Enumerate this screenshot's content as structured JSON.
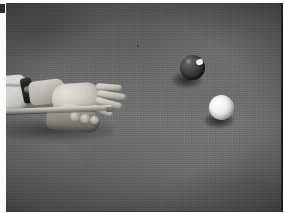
{
  "photo": {
    "title": "Billiards player bridging a cue on a pool table",
    "medium": "black-and-white photograph",
    "corner_mark_label": "5",
    "scene": {
      "surface_label": "pool table cloth",
      "surface_color": "#6a6b6d",
      "vignette": true
    },
    "subjects": {
      "player": {
        "label": "player hands and forearm",
        "shirt_cuff_label": "white shirt cuff",
        "shirt_cuff_color": "#eaeae6",
        "wrist_watch_label": "wrist watch",
        "wrist_watch_color": "#1a1a1a",
        "forearm_label": "forearm",
        "bridge_hand_label": "bridge hand",
        "support_hand_label": "supporting hand",
        "fingers": [
          {
            "name": "index finger"
          },
          {
            "name": "middle finger"
          },
          {
            "name": "ring finger"
          },
          {
            "name": "little finger"
          },
          {
            "name": "thumb"
          }
        ],
        "knuckles": [
          {
            "name": "knuckle one"
          },
          {
            "name": "knuckle two"
          },
          {
            "name": "knuckle three"
          }
        ],
        "cue_stick_label": "cue stick",
        "cue_tip_label": "cue tip",
        "shadow_label": "arm shadow"
      },
      "balls": [
        {
          "id": "object-ball",
          "label": "dark object ball",
          "color": "#2f2f2f",
          "marking_label": "numbered spot",
          "marking_color": "#ffffff",
          "shadow_label": "object ball shadow"
        },
        {
          "id": "cue-ball",
          "label": "white cue ball",
          "color": "#f4f4f4",
          "highlight_label": "specular highlight",
          "shadow_label": "cue ball shadow"
        }
      ]
    },
    "frame": {
      "border_right_color": "#1c1c1c",
      "border_bottom_color": "#3a3a3a",
      "matte_color": "#ffffff"
    }
  }
}
